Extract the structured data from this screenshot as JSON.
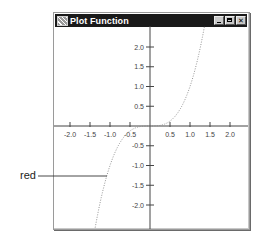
{
  "window": {
    "title": "Plot Function",
    "controls": {
      "minimize": "_",
      "maximize": "□",
      "close": "✕"
    }
  },
  "callout": {
    "label": "red"
  },
  "chart_data": {
    "type": "line",
    "title": "Plot Function",
    "function": "y = x^3",
    "xlabel": "",
    "ylabel": "",
    "xlim": [
      -2.4,
      2.4
    ],
    "ylim": [
      -2.5,
      2.5
    ],
    "grid": false,
    "x_ticks": [
      "-2.0",
      "-1.5",
      "-1.0",
      "-0.5",
      "0.5",
      "1.0",
      "1.5",
      "2.0"
    ],
    "y_ticks": [
      "2.0",
      "1.5",
      "1.0",
      "0.5",
      "-0.5",
      "-1.0",
      "-1.5",
      "-2.0"
    ],
    "series": [
      {
        "name": "red",
        "style": "dotted",
        "x": [
          -1.35,
          -1.2,
          -1.0,
          -0.8,
          -0.6,
          -0.4,
          -0.2,
          0.0,
          0.2,
          0.4,
          0.6,
          0.8,
          1.0,
          1.2,
          1.35
        ],
        "y": [
          -2.46,
          -1.73,
          -1.0,
          -0.51,
          -0.22,
          -0.06,
          -0.01,
          0.0,
          0.01,
          0.06,
          0.22,
          0.51,
          1.0,
          1.73,
          2.46
        ]
      }
    ],
    "annotations": [
      {
        "text": "red",
        "points_to": [
          -1.05,
          -1.2
        ]
      }
    ]
  }
}
